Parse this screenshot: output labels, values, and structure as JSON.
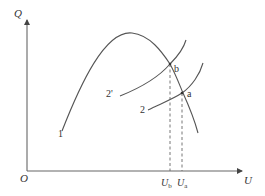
{
  "diagram": {
    "axes": {
      "y_label": "Q",
      "x_label": "U",
      "origin_label": "O"
    },
    "curves": [
      {
        "id": "1",
        "label": "1",
        "description": "hump-shaped curve rising to a peak then falling"
      },
      {
        "id": "2",
        "label": "2",
        "description": "rising curve intersecting curve 1 at point a"
      },
      {
        "id": "2prime",
        "label": "2'",
        "description": "rising curve intersecting curve 1 at point b"
      }
    ],
    "points": [
      {
        "id": "a",
        "label": "a"
      },
      {
        "id": "b",
        "label": "b"
      }
    ],
    "x_ticks": {
      "Ub": {
        "main": "U",
        "sub": "b"
      },
      "Ua": {
        "main": "U",
        "sub": "a"
      }
    },
    "colors": {
      "line": "#555555",
      "text": "#333333",
      "background": "#ffffff"
    }
  }
}
